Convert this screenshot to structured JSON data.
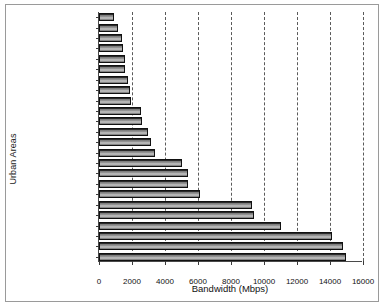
{
  "figure": {
    "background_color": "#ffffff",
    "border_color": "#9a9a9a",
    "bar_edge_color": "#111111",
    "gridline_color": "#5a5a5a"
  },
  "chart_data": {
    "type": "bar",
    "orientation": "horizontal",
    "title": "",
    "xlabel": "Bandwidth (Mbps)",
    "ylabel": "Urban Areas",
    "xlim": [
      0,
      16000
    ],
    "ylim": null,
    "grid": true,
    "grid_axis": "x",
    "grid_style": "dashed",
    "legend": false,
    "xticks": [
      0,
      2000,
      4000,
      6000,
      8000,
      10000,
      12000,
      14000,
      16000
    ],
    "xtick_labels": [
      "0",
      "2000",
      "4000",
      "6000",
      "8000",
      "10000",
      "12000",
      "14000",
      "16000"
    ],
    "categories": [
      "Orlando",
      "Detroit",
      "San Diego",
      "Austin",
      "Minneapolis-St. Paul",
      "Miami",
      "Columbus",
      "St. Louis",
      "Pittsburgh",
      "Phoenix",
      "Kansas City",
      "Boston",
      "Houston",
      "Cleveland",
      "Philadelphia",
      "Seattle",
      "Atlanta",
      "Denver",
      "Los Angeles",
      "New York",
      "Dallas-Fort Worth",
      "Washington",
      "Chicago",
      "San Francisco"
    ],
    "values": [
      900,
      1150,
      1400,
      1450,
      1550,
      1600,
      1750,
      1900,
      1950,
      2550,
      2600,
      2950,
      3150,
      3400,
      5050,
      5400,
      5400,
      6100,
      9250,
      9400,
      11000,
      14100,
      14800,
      14950
    ]
  }
}
